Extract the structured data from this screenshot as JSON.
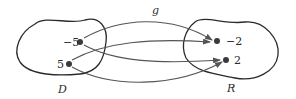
{
  "function_label": "g",
  "domain": {
    "label": "D",
    "points": [
      {
        "value": "-5",
        "display": "−5"
      },
      {
        "value": "5",
        "display": "5"
      }
    ]
  },
  "range": {
    "label": "R",
    "points": [
      {
        "value": "-2",
        "display": "−2"
      },
      {
        "value": "2",
        "display": "2"
      }
    ]
  },
  "mappings": [
    {
      "from": "-5",
      "to": "-2"
    },
    {
      "from": "-5",
      "to": "2"
    },
    {
      "from": "5",
      "to": "-2"
    },
    {
      "from": "5",
      "to": "2"
    }
  ],
  "colors": {
    "stroke": "#2a2a2a",
    "arrow": "#555555",
    "point": "#3a3a3a"
  }
}
